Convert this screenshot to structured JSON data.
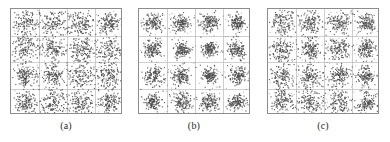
{
  "figure": {
    "background_color": "#ffffff",
    "frame_color": "#8d8d8d",
    "grid_color": "#b9b9b9",
    "point_color": "#4a4a4a"
  },
  "panels": [
    {
      "id": "panel-a",
      "caption": "(a)",
      "x": 10,
      "y": 8,
      "width": 112,
      "height": 106,
      "grid_cols": 4,
      "grid_rows": 4,
      "cluster_spread": 6.2,
      "points_per_cluster": 150,
      "seed": 11
    },
    {
      "id": "panel-b",
      "caption": "(b)",
      "x": 138,
      "y": 8,
      "width": 112,
      "height": 106,
      "grid_cols": 4,
      "grid_rows": 4,
      "cluster_spread": 4.6,
      "points_per_cluster": 150,
      "seed": 27
    },
    {
      "id": "panel-c",
      "caption": "(c)",
      "x": 267,
      "y": 8,
      "width": 112,
      "height": 106,
      "grid_cols": 4,
      "grid_rows": 4,
      "cluster_spread": 5.4,
      "points_per_cluster": 150,
      "seed": 43
    }
  ],
  "chart_data": {
    "type": "scatter",
    "title": "",
    "xlabel": "",
    "ylabel": "",
    "grid": true,
    "legend": null,
    "subplot_captions": [
      "(a)",
      "(b)",
      "(c)"
    ],
    "constellation_levels": [
      -3,
      -1,
      1,
      3
    ],
    "cluster_centers": [
      [
        -3,
        3
      ],
      [
        -1,
        3
      ],
      [
        1,
        3
      ],
      [
        3,
        3
      ],
      [
        -3,
        1
      ],
      [
        -1,
        1
      ],
      [
        1,
        1
      ],
      [
        3,
        1
      ],
      [
        -3,
        -1
      ],
      [
        -1,
        -1
      ],
      [
        1,
        -1
      ],
      [
        3,
        -1
      ],
      [
        -3,
        -3
      ],
      [
        -1,
        -3
      ],
      [
        1,
        -3
      ],
      [
        3,
        -3
      ]
    ],
    "xlim": [
      -4,
      4
    ],
    "ylim": [
      -4,
      4
    ],
    "series": [
      {
        "name": "(a)",
        "cluster_count": 16,
        "points_per_cluster": 150,
        "noise_sigma": 0.33
      },
      {
        "name": "(b)",
        "cluster_count": 16,
        "points_per_cluster": 150,
        "noise_sigma": 0.24
      },
      {
        "name": "(c)",
        "cluster_count": 16,
        "points_per_cluster": 150,
        "noise_sigma": 0.29
      }
    ]
  }
}
